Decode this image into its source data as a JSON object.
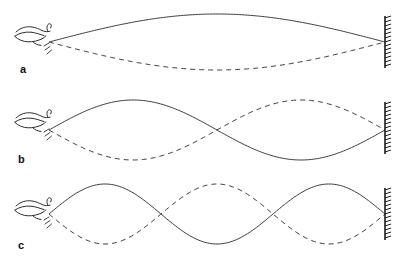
{
  "figure": {
    "background_color": "#ffffff",
    "line_color": "#3a3a3a",
    "label_color": "#111111",
    "wall_color": "#1c1c1c",
    "width": 406,
    "height": 264
  },
  "panels": [
    {
      "label": "a",
      "label_x": 20,
      "label_y": 64,
      "harmonic": 1,
      "loops": 1,
      "top": 0,
      "height": 86,
      "axis_y": 42,
      "amplitude": 28,
      "start_x": 49,
      "end_x": 385,
      "hand_x": 20,
      "hand_y": 24,
      "wall_x": 385,
      "wall_top": 16,
      "wall_bottom": 68,
      "solid_phase": "positive",
      "dashed_phase": "negative"
    },
    {
      "label": "b",
      "label_x": 18,
      "label_y": 158,
      "harmonic": 2,
      "loops": 2,
      "top": 86,
      "height": 86,
      "axis_y": 130,
      "amplitude": 30,
      "start_x": 49,
      "end_x": 385,
      "hand_x": 20,
      "hand_y": 110,
      "wall_x": 385,
      "wall_top": 104,
      "wall_bottom": 156,
      "solid_phase": "positive",
      "dashed_phase": "negative"
    },
    {
      "label": "c",
      "label_x": 18,
      "label_y": 240,
      "harmonic": 3,
      "loops": 3,
      "top": 172,
      "height": 92,
      "axis_y": 214,
      "amplitude": 30,
      "start_x": 49,
      "end_x": 385,
      "hand_x": 20,
      "hand_y": 192,
      "wall_x": 385,
      "wall_top": 188,
      "wall_bottom": 240,
      "solid_phase": "positive",
      "dashed_phase": "negative"
    }
  ],
  "icons": {
    "hand": "hand-holding-rope-icon",
    "wall": "fixed-wall-support-icon",
    "motion": "vibration-motion-lines-icon"
  },
  "chart_data": {
    "type": "line",
    "xlabel": "",
    "ylabel": "",
    "xlim": [
      49,
      385
    ],
    "ylim": [
      -1,
      1
    ],
    "grid": false,
    "legend": null,
    "annotations": [
      "a",
      "b",
      "c"
    ],
    "series": [
      {
        "name": "a-solid-fundamental",
        "panel": "a",
        "style": "solid",
        "loops": 1,
        "amplitude": 1,
        "description": "First harmonic, one antinode, maximum upward displacement"
      },
      {
        "name": "a-dashed-fundamental",
        "panel": "a",
        "style": "dashed",
        "loops": 1,
        "amplitude": -1,
        "description": "First harmonic, half period later, maximum downward displacement"
      },
      {
        "name": "b-solid-second-harmonic",
        "panel": "b",
        "style": "solid",
        "loops": 2,
        "amplitude": 1,
        "description": "Second harmonic, two antinodes, one interior node"
      },
      {
        "name": "b-dashed-second-harmonic",
        "panel": "b",
        "style": "dashed",
        "loops": 2,
        "amplitude": -1,
        "description": "Second harmonic, half period later, inverted"
      },
      {
        "name": "c-solid-third-harmonic",
        "panel": "c",
        "style": "solid",
        "loops": 3,
        "amplitude": 1,
        "description": "Third harmonic, three antinodes, two interior nodes"
      },
      {
        "name": "c-dashed-third-harmonic",
        "panel": "c",
        "style": "dashed",
        "loops": 3,
        "amplitude": -1,
        "description": "Third harmonic, half period later, inverted"
      }
    ]
  }
}
